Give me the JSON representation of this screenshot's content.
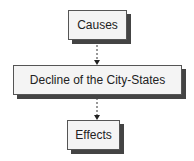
{
  "diagram": {
    "nodes": [
      {
        "id": "causes",
        "label": "Causes"
      },
      {
        "id": "decline",
        "label": "Decline of the City-States"
      },
      {
        "id": "effects",
        "label": "Effects"
      }
    ],
    "edges": [
      {
        "from": "causes",
        "to": "decline",
        "style": "dashed-arrow"
      },
      {
        "from": "decline",
        "to": "effects",
        "style": "dashed-arrow"
      }
    ]
  }
}
